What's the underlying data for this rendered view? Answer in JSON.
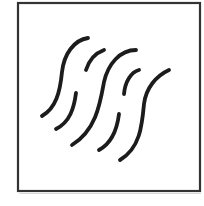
{
  "pictogram": {
    "description": "Square-framed symbol with five slanted wavy strokes; the 2nd and 4th strokes are broken into two segments",
    "colors": {
      "frame": "#333333",
      "stroke": "#1c1c1c",
      "background": "#ffffff"
    },
    "frame": {
      "x": 18,
      "y": 3,
      "width": 182,
      "height": 188
    },
    "strokes": [
      {
        "id": "wave-1",
        "broken": false
      },
      {
        "id": "wave-2",
        "broken": true
      },
      {
        "id": "wave-3",
        "broken": false
      },
      {
        "id": "wave-4",
        "broken": true
      },
      {
        "id": "wave-5",
        "broken": false
      }
    ],
    "stroke_count": "5"
  }
}
